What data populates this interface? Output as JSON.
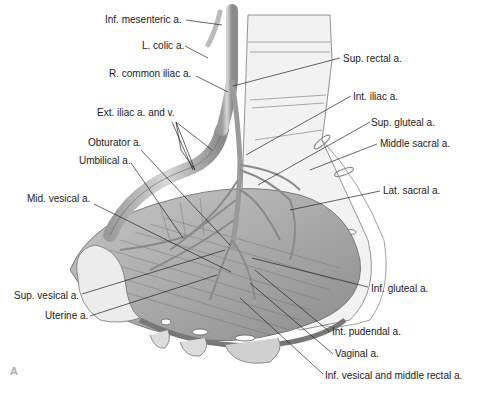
{
  "figure": {
    "panel_letter": "A",
    "labels": {
      "inf_mesenteric": "Inf. mesenteric a.",
      "l_colic": "L. colic a.",
      "r_common_iliac": "R. common iliac a.",
      "ext_iliac": "Ext. iliac a. and v.",
      "obturator": "Obturator a.",
      "umbilical": "Umbilical a.",
      "mid_vesical": "Mid. vesical a.",
      "sup_vesical": "Sup. vesical a.",
      "uterine": "Uterine a.",
      "sup_rectal": "Sup. rectal a.",
      "int_iliac": "Int. iliac a.",
      "sup_gluteal": "Sup. gluteal a.",
      "middle_sacral": "Middle sacral a.",
      "lat_sacral": "Lat. sacral a.",
      "inf_gluteal": "Inf. gluteal a.",
      "int_pudendal": "Int. pudendal a.",
      "vaginal": "Vaginal a.",
      "inf_vesical_middle_rectal": "Inf. vesical and middle rectal a."
    }
  }
}
